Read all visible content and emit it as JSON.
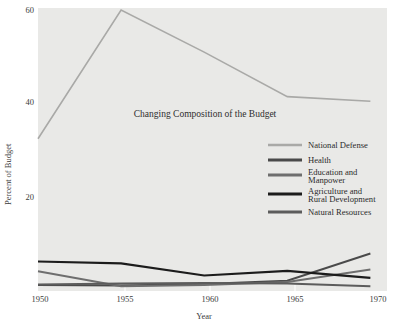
{
  "chart_data": {
    "type": "line",
    "title": "Changing Composition of the Budget",
    "xlabel": "Year",
    "ylabel": "Percent of Budget",
    "x": [
      1950,
      1955,
      1960,
      1965,
      1970
    ],
    "xtick_labels": [
      "1950",
      "1955",
      "1960",
      "1965",
      "1970"
    ],
    "ytick_labels": [
      "20",
      "40",
      "60"
    ],
    "yticks": [
      20,
      40,
      60
    ],
    "xlim": [
      1950,
      1971
    ],
    "ylim": [
      0,
      60
    ],
    "grid": false,
    "legend_position": "center-right inside plot",
    "background_color": "#e9e9e7",
    "series": [
      {
        "name": "National Defense",
        "color": "#a9a9a7",
        "width": 1.6,
        "values": [
          32.5,
          60.0,
          51.0,
          41.5,
          40.5
        ]
      },
      {
        "name": "Health",
        "color": "#4a4a4a",
        "width": 2.0,
        "values": [
          1.3,
          1.2,
          1.5,
          2.2,
          8.0
        ]
      },
      {
        "name": "Education and Manpower",
        "color": "#6e6e6e",
        "width": 2.0,
        "values": [
          4.2,
          1.0,
          1.3,
          1.9,
          4.6
        ]
      },
      {
        "name": "Agriculture and Rural Development",
        "color": "#1c1c1c",
        "width": 2.1,
        "values": [
          6.3,
          5.9,
          3.3,
          4.3,
          2.8
        ]
      },
      {
        "name": "Natural Resources",
        "color": "#5c5c5c",
        "width": 2.0,
        "values": [
          1.4,
          1.6,
          1.7,
          1.6,
          1.0
        ]
      }
    ]
  },
  "legend": {
    "items": [
      {
        "label": "National Defense",
        "color": "#a9a9a7"
      },
      {
        "label": "Health",
        "color": "#4a4a4a"
      },
      {
        "label": "Education and",
        "label2": "Manpower",
        "color": "#6e6e6e"
      },
      {
        "label": "Agriculture and",
        "label2": "Rural Development",
        "color": "#1c1c1c"
      },
      {
        "label": "Natural Resources",
        "color": "#5c5c5c"
      }
    ]
  }
}
